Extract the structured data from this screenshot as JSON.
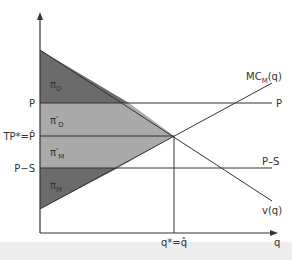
{
  "diagram": {
    "axes": {
      "x_label": "q",
      "y_label": ""
    },
    "price_levels": {
      "p": "P",
      "tp_star": "TP*=P̂",
      "p_minus_s": "P−S"
    },
    "curves": {
      "mc": "MC",
      "mc_sub": "M",
      "mc_arg": "(q)",
      "v": "v(q)",
      "right_p": "P",
      "right_ps": "P–S"
    },
    "quantity_label": "q*=q̂",
    "regions": {
      "pi_d": {
        "sym": "π",
        "sub": "D"
      },
      "pi_d_prime": {
        "sym": "π′",
        "sub": "D"
      },
      "pi_m_prime": {
        "sym": "π′",
        "sub": "M"
      },
      "pi_m": {
        "sym": "π",
        "sub": "M"
      }
    },
    "colors": {
      "dark_region": "#6b6b6b",
      "light_region": "#aaaaaa",
      "line": "#333333"
    }
  }
}
